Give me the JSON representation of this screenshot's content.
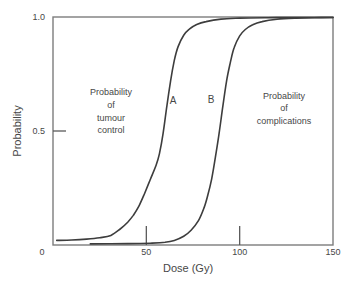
{
  "figure": {
    "background": "#ffffff"
  },
  "colors": {
    "curve": "#3d3d3d",
    "axis_box": "#7d7d7d",
    "tick_mark": "#5a5a5a",
    "text": "#474747"
  },
  "annotations": {
    "tumour_control": {
      "lines": [
        "Probability",
        "of",
        "tumour",
        "control"
      ]
    },
    "complications": {
      "lines": [
        "Probability",
        "of",
        "complications"
      ]
    },
    "curve_a_label": "A",
    "curve_b_label": "B"
  },
  "chart_data": {
    "type": "line",
    "title": "",
    "xlabel": "Dose (Gy)",
    "ylabel": "Probability",
    "xlim": [
      0,
      150
    ],
    "ylim": [
      0,
      1.0
    ],
    "grid": false,
    "legend_position": "none",
    "x_ticks": [
      {
        "value": 0,
        "label": "0",
        "mark": false
      },
      {
        "value": 50,
        "label": "50",
        "mark": true
      },
      {
        "value": 100,
        "label": "100",
        "mark": true
      },
      {
        "value": 150,
        "label": "150",
        "mark": false
      }
    ],
    "y_ticks": [
      {
        "value": 0.5,
        "label": "0.5",
        "mark": true
      },
      {
        "value": 1.0,
        "label": "1.0",
        "mark": false
      }
    ],
    "series": [
      {
        "name": "tumour-control-curve",
        "label": "A",
        "meaning": "Probability of tumour control",
        "points": [
          [
            2,
            0.02
          ],
          [
            10,
            0.022
          ],
          [
            18,
            0.026
          ],
          [
            25,
            0.032
          ],
          [
            31,
            0.042
          ],
          [
            36,
            0.07
          ],
          [
            40,
            0.1
          ],
          [
            43,
            0.13
          ],
          [
            46,
            0.17
          ],
          [
            49,
            0.225
          ],
          [
            52,
            0.285
          ],
          [
            55,
            0.345
          ],
          [
            57,
            0.4
          ],
          [
            59,
            0.49
          ],
          [
            61,
            0.61
          ],
          [
            63,
            0.72
          ],
          [
            65,
            0.81
          ],
          [
            67,
            0.87
          ],
          [
            70,
            0.92
          ],
          [
            73,
            0.947
          ],
          [
            77,
            0.967
          ],
          [
            82,
            0.98
          ],
          [
            90,
            0.991
          ],
          [
            100,
            0.995
          ],
          [
            115,
            0.997
          ],
          [
            130,
            0.9975
          ],
          [
            150,
            0.998
          ]
        ]
      },
      {
        "name": "complications-curve",
        "label": "B",
        "meaning": "Probability of complications",
        "points": [
          [
            20,
            0.005
          ],
          [
            40,
            0.006
          ],
          [
            52,
            0.008
          ],
          [
            60,
            0.012
          ],
          [
            65,
            0.02
          ],
          [
            70,
            0.038
          ],
          [
            74,
            0.065
          ],
          [
            78,
            0.108
          ],
          [
            81,
            0.165
          ],
          [
            83,
            0.22
          ],
          [
            85,
            0.29
          ],
          [
            87,
            0.385
          ],
          [
            89,
            0.49
          ],
          [
            91,
            0.61
          ],
          [
            93,
            0.72
          ],
          [
            95,
            0.8
          ],
          [
            97,
            0.865
          ],
          [
            100,
            0.917
          ],
          [
            103,
            0.945
          ],
          [
            107,
            0.966
          ],
          [
            112,
            0.98
          ],
          [
            120,
            0.99
          ],
          [
            130,
            0.995
          ],
          [
            140,
            0.997
          ],
          [
            150,
            0.998
          ]
        ]
      }
    ]
  }
}
